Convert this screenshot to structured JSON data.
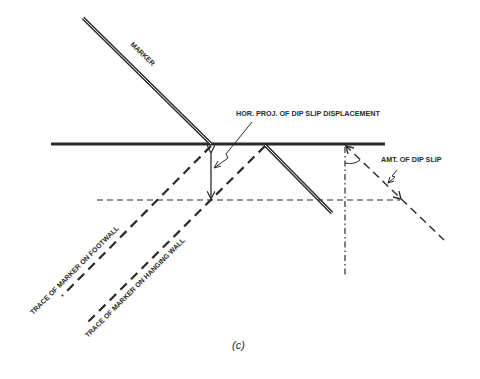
{
  "diagram": {
    "caption": "(c)",
    "labels": {
      "marker": "MARKER",
      "hor_proj": "HOR. PROJ. OF DIP SLIP DISPLACEMENT",
      "amt_dip_slip": "AMT. OF DIP SLIP",
      "trace_footwall": "TRACE OF MARKER ON FOOTWALL",
      "trace_hanging_wall": "TRACE OF MARKER ON HANGING WALL"
    },
    "colors": {
      "ink": "#2a2a2a",
      "background": "#ffffff"
    }
  }
}
